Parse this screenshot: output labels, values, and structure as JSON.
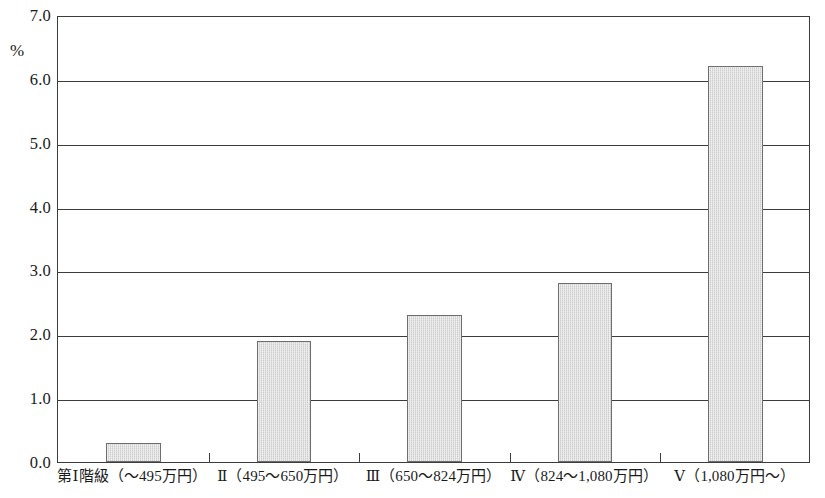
{
  "chart_data": {
    "type": "bar",
    "title": "",
    "subtitle": "",
    "xlabel": "",
    "ylabel": "%",
    "ylim": [
      0.0,
      7.0
    ],
    "ytick_step": 1.0,
    "grid": true,
    "legend": false,
    "legend_position": "none",
    "categories": [
      "第Ⅰ階級（～495万円）",
      "Ⅱ（495～650万円）",
      "Ⅲ（650～824万円）",
      "Ⅳ（824～1,080万円）",
      "Ⅴ（1,080万円～）"
    ],
    "values": [
      0.3,
      1.9,
      2.3,
      2.8,
      6.2
    ],
    "ytick_labels": [
      "7.0",
      "6.0",
      "5.0",
      "4.0",
      "3.0",
      "2.0",
      "1.0",
      "0.0"
    ],
    "ytick_values": [
      7.0,
      6.0,
      5.0,
      4.0,
      3.0,
      2.0,
      1.0,
      0.0
    ]
  },
  "style": {
    "bar_fill": "#dcdcdc",
    "bar_border": "#6e6e6e",
    "axis_color": "#3c3c3c",
    "background": "#ffffff",
    "text_color": "#1a1a1a"
  }
}
